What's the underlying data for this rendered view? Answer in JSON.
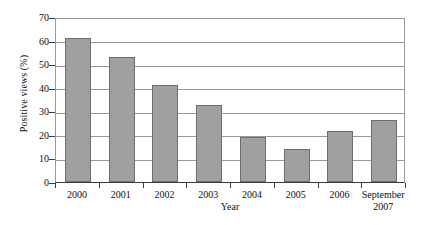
{
  "chart_data": {
    "type": "bar",
    "title": "",
    "xlabel": "Year",
    "ylabel": "Positive views (%)",
    "categories": [
      "2000",
      "2001",
      "2002",
      "2003",
      "2004",
      "2005",
      "2006",
      "September 2007"
    ],
    "category_lines": [
      [
        "2000"
      ],
      [
        "2001"
      ],
      [
        "2002"
      ],
      [
        "2003"
      ],
      [
        "2004"
      ],
      [
        "2005"
      ],
      [
        "2006"
      ],
      [
        "September",
        "2007"
      ]
    ],
    "values": [
      61,
      53,
      41,
      32.5,
      19,
      14,
      21.5,
      26.5
    ],
    "ylim": [
      0,
      70
    ],
    "ytick_labels": [
      "0",
      "10",
      "20",
      "30",
      "40",
      "50",
      "60",
      "70"
    ],
    "ytick_values": [
      0,
      10,
      20,
      30,
      40,
      50,
      60,
      70
    ],
    "grid": true,
    "legend": "none",
    "colors": {
      "bar_fill": "#a0a0a0",
      "bar_border": "#6e6e6e",
      "gridline": "#9a9a9a",
      "axis": "#3c3c3c",
      "text": "#111111",
      "background": "#ffffff"
    }
  }
}
